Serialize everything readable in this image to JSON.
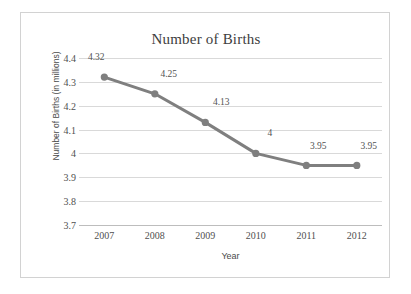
{
  "chart_data": {
    "type": "line",
    "title": "Number of Births",
    "xlabel": "Year",
    "ylabel": "Number of Births (in millions)",
    "categories": [
      "2007",
      "2008",
      "2009",
      "2010",
      "2011",
      "2012"
    ],
    "values": [
      4.32,
      4.25,
      4.13,
      4,
      3.95,
      3.95
    ],
    "point_labels": [
      "4.32",
      "4.25",
      "4.13",
      "4",
      "3.95",
      "3.95"
    ],
    "ylim": [
      3.7,
      4.4
    ],
    "yticks": [
      "4.4",
      "4.3",
      "4.2",
      "4.1",
      "4",
      "3.9",
      "3.8",
      "3.7"
    ],
    "ytick_values": [
      4.4,
      4.3,
      4.2,
      4.1,
      4,
      3.9,
      3.8,
      3.7
    ],
    "grid": true,
    "legend": "none",
    "series_color": "#7f7f7f",
    "grid_color": "#d9d9d9",
    "axis_color": "#bdbdbd",
    "text_color": "#4f4f4f",
    "title_color": "#3d3d3d"
  }
}
